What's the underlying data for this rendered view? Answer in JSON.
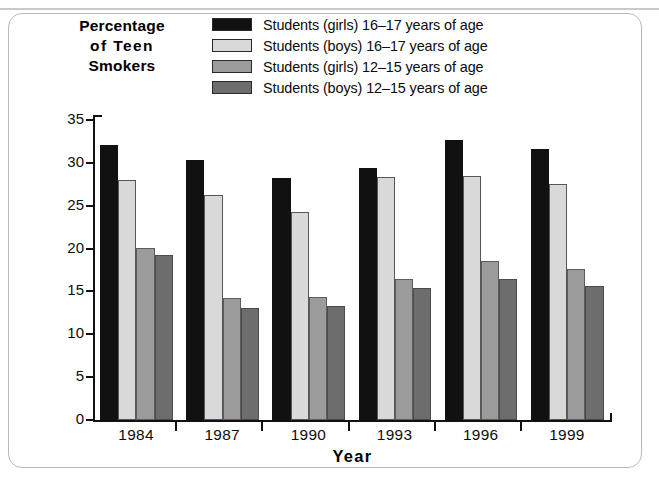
{
  "figure": {
    "y_axis_title_lines": [
      "Percentage",
      "of  Teen",
      "Smokers"
    ],
    "x_axis_title": "Year"
  },
  "legend": {
    "items": [
      {
        "label": "Students (girls) 16–17 years of age",
        "color": "#111111"
      },
      {
        "label": "Students (boys) 16–17 years of age",
        "color": "#d9d9d9"
      },
      {
        "label": "Students (girls) 12–15 years of age",
        "color": "#9b9b9b"
      },
      {
        "label": "Students (boys) 12–15 years of age",
        "color": "#6d6d6d"
      }
    ]
  },
  "chart_data": {
    "type": "bar",
    "title": "Percentage of Teen Smokers",
    "xlabel": "Year",
    "ylabel": "Percentage of Teen Smokers",
    "categories": [
      "1984",
      "1987",
      "1990",
      "1993",
      "1996",
      "1999"
    ],
    "series": [
      {
        "name": "Students (girls) 16–17 years of age",
        "color": "#111111",
        "values": [
          32.1,
          30.3,
          28.2,
          29.4,
          32.7,
          31.6
        ]
      },
      {
        "name": "Students (boys) 16–17 years of age",
        "color": "#d9d9d9",
        "values": [
          28.0,
          26.2,
          24.3,
          28.4,
          28.5,
          27.5
        ]
      },
      {
        "name": "Students (girls) 12–15 years of age",
        "color": "#9b9b9b",
        "values": [
          20.1,
          14.2,
          14.3,
          16.4,
          18.5,
          17.6
        ]
      },
      {
        "name": "Students (boys) 12–15 years of age",
        "color": "#6d6d6d",
        "values": [
          19.2,
          13.1,
          13.3,
          15.4,
          16.5,
          15.6
        ]
      }
    ],
    "ylim": [
      0,
      35
    ],
    "yticks": [
      0,
      5,
      10,
      15,
      20,
      25,
      30,
      35
    ],
    "ytick_labels": [
      "0",
      "5",
      "10",
      "15",
      "20",
      "25",
      "30",
      "35"
    ],
    "grid": false,
    "legend_position": "top"
  }
}
